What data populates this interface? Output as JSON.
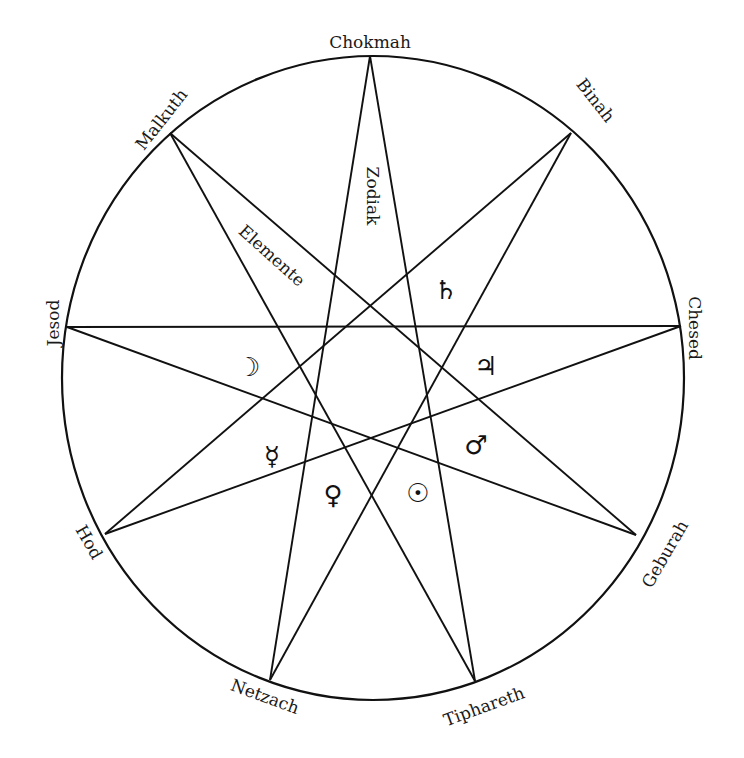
{
  "diagram": {
    "type": "enneagram-star",
    "colors": {
      "background": "#ffffff",
      "stroke": "#111111",
      "text": "#1a1a1a"
    },
    "circle": {
      "cx": 373,
      "cy": 378,
      "rx": 311,
      "ry": 322
    },
    "vertices": [
      {
        "id": "chokmah",
        "label": "Chokmah",
        "x": 370,
        "y": 56
      },
      {
        "id": "binah",
        "label": "Binah",
        "x": 571,
        "y": 133
      },
      {
        "id": "chesed",
        "label": "Chesed",
        "x": 681,
        "y": 326
      },
      {
        "id": "geburah",
        "label": "Geburah",
        "x": 636,
        "y": 535
      },
      {
        "id": "tiphareth",
        "label": "Tiphareth",
        "x": 475,
        "y": 681
      },
      {
        "id": "netzach",
        "label": "Netzach",
        "x": 270,
        "y": 680
      },
      {
        "id": "hod",
        "label": "Hod",
        "x": 105,
        "y": 534
      },
      {
        "id": "jesod",
        "label": "Jesod",
        "x": 67,
        "y": 327
      },
      {
        "id": "malkuth",
        "label": "Malkuth",
        "x": 170,
        "y": 133
      }
    ],
    "inner_labels": {
      "zodiak": "Zodiak",
      "elemente": "Elemente"
    },
    "planet_symbols": [
      {
        "name": "saturn",
        "glyph": "♄",
        "x": 446,
        "y": 290
      },
      {
        "name": "jupiter",
        "glyph": "♃",
        "x": 486,
        "y": 366
      },
      {
        "name": "moon",
        "glyph": "☽",
        "x": 249,
        "y": 367
      },
      {
        "name": "mars",
        "glyph": "♂",
        "x": 476,
        "y": 445
      },
      {
        "name": "mercury",
        "glyph": "☿",
        "x": 272,
        "y": 456
      },
      {
        "name": "venus",
        "glyph": "♀",
        "x": 333,
        "y": 495
      },
      {
        "name": "sun",
        "glyph": "☉",
        "x": 418,
        "y": 493
      }
    ]
  }
}
